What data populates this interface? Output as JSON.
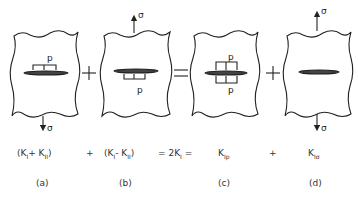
{
  "figure": {
    "symbols": {
      "stress": "σ",
      "pressure": "p"
    },
    "operators": {
      "plus": "+",
      "equals": "="
    },
    "panels": [
      {
        "id": "a",
        "label": "(a)",
        "crack_load": "pressure on top face",
        "remote_stress": "bottom"
      },
      {
        "id": "b",
        "label": "(b)",
        "crack_load": "pressure on bottom face",
        "remote_stress": "top"
      },
      {
        "id": "c",
        "label": "(c)",
        "crack_load": "pressure on both faces",
        "remote_stress": "none"
      },
      {
        "id": "d",
        "label": "(d)",
        "crack_load": "none",
        "remote_stress": "top and bottom"
      }
    ],
    "equation": {
      "a": {
        "open": "(K",
        "s1": "I",
        "op": "+ K",
        "s2": "II",
        "close": ")"
      },
      "plus1": "+",
      "b": {
        "open": "(K",
        "s1": "I",
        "op": "- K",
        "s2": "II",
        "close": ")"
      },
      "eq1": "= 2K",
      "eq1_sub": "I",
      "eq2": "=",
      "c": {
        "k": "K",
        "sub": "Ip"
      },
      "plus2": "+",
      "d": {
        "k": "K",
        "sub": "Iσ"
      }
    }
  }
}
